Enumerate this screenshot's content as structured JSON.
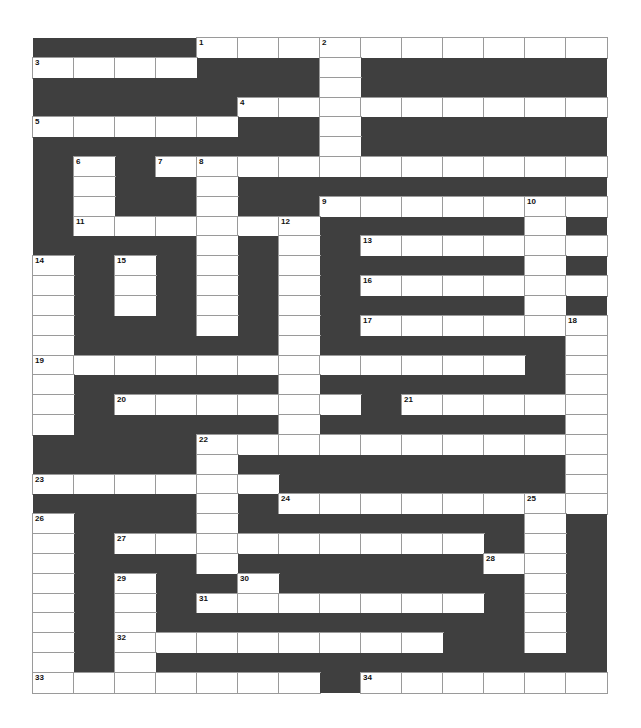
{
  "puzzle": {
    "cols": 14,
    "rows": 33,
    "colors": {
      "block": "#3f3f3f",
      "cell": "#ffffff",
      "line": "#9a9a9a"
    },
    "grid": [
      "####1..2......",
      "3...###.######",
      "#######.######",
      "#####4........#",
      "5....##.######",
      "#######.######",
      "#6#78.........#",
      "#.##.#########",
      "#.##.##9....A.",
      "#B....C#####.#",
      "####.#.#D.....",
      "E#F#.#.#####.#",
      ".#.#.#.#G.....",
      ".#.#.#.#####.#",
      ".###.#.#H....I",
      ".#####.######.",
      "J...........#.",
      ".#####.######.",
      ".#K.....#L....",
      ".#####.######.",
      "####M.........",
      "####.########.",
      "N.....#######.",
      "####.#O.....P.",
      "Q###.#######.#",
      ".#R........#.#",
      ".###.######S.#",
      ".#T##U######.#",
      ".#.#V......#.#",
      ".#.#########.#",
      ".#W.......##.#",
      ".#.###########",
      "X......#Y....."
    ],
    "numbers": [
      {
        "r": 0,
        "c": 4,
        "n": "1"
      },
      {
        "r": 0,
        "c": 7,
        "n": "2"
      },
      {
        "r": 1,
        "c": 0,
        "n": "3"
      },
      {
        "r": 3,
        "c": 5,
        "n": "4"
      },
      {
        "r": 4,
        "c": 0,
        "n": "5"
      },
      {
        "r": 6,
        "c": 1,
        "n": "6"
      },
      {
        "r": 6,
        "c": 3,
        "n": "7"
      },
      {
        "r": 6,
        "c": 4,
        "n": "8"
      },
      {
        "r": 8,
        "c": 7,
        "n": "9"
      },
      {
        "r": 8,
        "c": 12,
        "n": "10"
      },
      {
        "r": 9,
        "c": 1,
        "n": "11"
      },
      {
        "r": 9,
        "c": 6,
        "n": "12"
      },
      {
        "r": 10,
        "c": 8,
        "n": "13"
      },
      {
        "r": 11,
        "c": 0,
        "n": "14"
      },
      {
        "r": 11,
        "c": 2,
        "n": "15"
      },
      {
        "r": 12,
        "c": 8,
        "n": "16"
      },
      {
        "r": 14,
        "c": 8,
        "n": "17"
      },
      {
        "r": 14,
        "c": 13,
        "n": "18"
      },
      {
        "r": 16,
        "c": 0,
        "n": "19"
      },
      {
        "r": 18,
        "c": 2,
        "n": "20"
      },
      {
        "r": 18,
        "c": 9,
        "n": "21"
      },
      {
        "r": 20,
        "c": 4,
        "n": "22"
      },
      {
        "r": 22,
        "c": 0,
        "n": "23"
      },
      {
        "r": 23,
        "c": 6,
        "n": "24"
      },
      {
        "r": 23,
        "c": 12,
        "n": "25"
      },
      {
        "r": 24,
        "c": 0,
        "n": "26"
      },
      {
        "r": 25,
        "c": 2,
        "n": "27"
      },
      {
        "r": 26,
        "c": 11,
        "n": "28"
      },
      {
        "r": 27,
        "c": 2,
        "n": "29"
      },
      {
        "r": 27,
        "c": 5,
        "n": "30"
      },
      {
        "r": 28,
        "c": 4,
        "n": "31"
      },
      {
        "r": 30,
        "c": 2,
        "n": "32"
      },
      {
        "r": 32,
        "c": 0,
        "n": "33"
      },
      {
        "r": 32,
        "c": 8,
        "n": "34"
      }
    ]
  }
}
